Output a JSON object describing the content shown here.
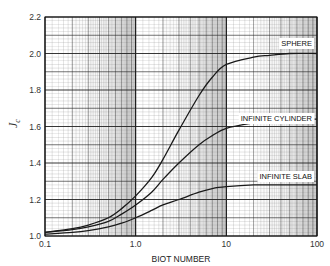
{
  "chart_data": {
    "type": "line",
    "title": "",
    "xlabel": "BIOT NUMBER",
    "ylabel": "J_c",
    "ylabel_main": "J",
    "ylabel_sub": "c",
    "xscale": "log",
    "xlim": [
      0.1,
      100
    ],
    "ylim": [
      1.0,
      2.2
    ],
    "grid": true,
    "x_ticks": [
      0.1,
      1.0,
      10,
      100
    ],
    "x_tick_labels": [
      "0.1",
      "1.0",
      "10",
      "100"
    ],
    "y_ticks": [
      1.0,
      1.2,
      1.4,
      1.6,
      1.8,
      2.0,
      2.2
    ],
    "y_tick_labels": [
      "1.0",
      "1.2",
      "1.4",
      "1.6",
      "1.8",
      "2.0",
      "2.2"
    ],
    "x": [
      0.1,
      0.2,
      0.3,
      0.5,
      0.7,
      1.0,
      1.5,
      2.0,
      3.0,
      5.0,
      7.0,
      10,
      20,
      30,
      50,
      100
    ],
    "series": [
      {
        "name": "SPHERE",
        "values": [
          1.02,
          1.04,
          1.06,
          1.1,
          1.15,
          1.22,
          1.32,
          1.42,
          1.58,
          1.77,
          1.87,
          1.94,
          1.98,
          1.99,
          2.0,
          2.0
        ]
      },
      {
        "name": "INFINITE CYLINDER",
        "values": [
          1.02,
          1.035,
          1.05,
          1.08,
          1.12,
          1.17,
          1.24,
          1.31,
          1.4,
          1.5,
          1.55,
          1.59,
          1.62,
          1.63,
          1.64,
          1.64
        ]
      },
      {
        "name": "INFINITE SLAB",
        "values": [
          1.01,
          1.02,
          1.03,
          1.05,
          1.07,
          1.1,
          1.14,
          1.17,
          1.2,
          1.24,
          1.26,
          1.27,
          1.28,
          1.28,
          1.28,
          1.28
        ]
      }
    ],
    "annotations": [
      {
        "text": "SPHERE",
        "series": "SPHERE"
      },
      {
        "text": "INFINITE CYLINDER",
        "series": "INFINITE CYLINDER"
      },
      {
        "text": "INFINITE SLAB",
        "series": "INFINITE SLAB"
      }
    ],
    "legend": "inline labels at right end of curves"
  },
  "colors": {
    "curve": "#1a1a1a",
    "grid_major": "#222222",
    "grid_minor": "#8a8a8a",
    "background": "#ffffff",
    "shade_band": "#9a9a9a"
  }
}
